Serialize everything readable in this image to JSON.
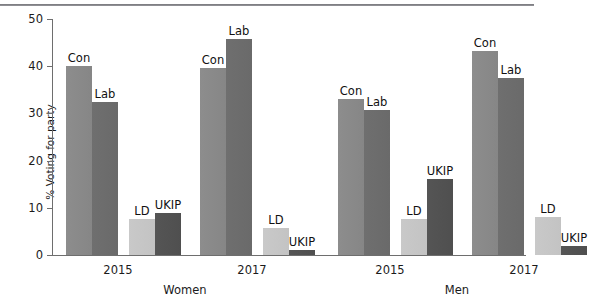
{
  "figure": {
    "ylabel": "% Voting for party"
  },
  "axis": {
    "ticks": [
      {
        "value": 0,
        "label": "0"
      },
      {
        "value": 10,
        "label": "10"
      },
      {
        "value": 20,
        "label": "20"
      },
      {
        "value": 30,
        "label": "30"
      },
      {
        "value": 40,
        "label": "40"
      },
      {
        "value": 50,
        "label": "50"
      }
    ]
  },
  "panels": [
    {
      "label": "Women",
      "groups": [
        "2015",
        "2017"
      ]
    },
    {
      "label": "Men",
      "groups": [
        "2015",
        "2017"
      ]
    }
  ],
  "chart_data": {
    "type": "bar",
    "title": "",
    "xlabel": "",
    "ylabel": "% Voting for party",
    "ylim": [
      0,
      50
    ],
    "yticks": [
      0,
      10,
      20,
      30,
      40,
      50
    ],
    "grid": false,
    "legend": "none",
    "panel_labels": [
      "Women",
      "Men"
    ],
    "categories": [
      "Women 2015",
      "Women 2017",
      "Men 2015",
      "Men 2017"
    ],
    "series": [
      {
        "name": "Con",
        "color": "#8a8a8a",
        "values": [
          40.0,
          39.7,
          33.0,
          43.2
        ]
      },
      {
        "name": "Lab",
        "color": "#6d6d6d",
        "values": [
          32.5,
          45.8,
          30.7,
          37.6
        ]
      },
      {
        "name": "LD",
        "color": "#c6c6c6",
        "values": [
          7.7,
          5.7,
          7.6,
          8.0
        ]
      },
      {
        "name": "UKIP",
        "color": "#525252",
        "values": [
          9.0,
          1.0,
          16.0,
          2.0
        ]
      }
    ],
    "bars": [
      {
        "panel": "Women",
        "group": "2015",
        "party": "Con",
        "value": 40.0,
        "label": "Con"
      },
      {
        "panel": "Women",
        "group": "2015",
        "party": "Lab",
        "value": 32.5,
        "label": "Lab"
      },
      {
        "panel": "Women",
        "group": "2015",
        "party": "LD",
        "value": 7.7,
        "label": "LD"
      },
      {
        "panel": "Women",
        "group": "2015",
        "party": "UKIP",
        "value": 9.0,
        "label": "UKIP"
      },
      {
        "panel": "Women",
        "group": "2017",
        "party": "Con",
        "value": 39.7,
        "label": "Con"
      },
      {
        "panel": "Women",
        "group": "2017",
        "party": "Lab",
        "value": 45.8,
        "label": "Lab"
      },
      {
        "panel": "Women",
        "group": "2017",
        "party": "LD",
        "value": 5.7,
        "label": "LD"
      },
      {
        "panel": "Women",
        "group": "2017",
        "party": "UKIP",
        "value": 1.0,
        "label": "UKIP"
      },
      {
        "panel": "Men",
        "group": "2015",
        "party": "Con",
        "value": 33.0,
        "label": "Con"
      },
      {
        "panel": "Men",
        "group": "2015",
        "party": "Lab",
        "value": 30.7,
        "label": "Lab"
      },
      {
        "panel": "Men",
        "group": "2015",
        "party": "LD",
        "value": 7.6,
        "label": "LD"
      },
      {
        "panel": "Men",
        "group": "2015",
        "party": "UKIP",
        "value": 16.0,
        "label": "UKIP"
      },
      {
        "panel": "Men",
        "group": "2017",
        "party": "Con",
        "value": 43.2,
        "label": "Con"
      },
      {
        "panel": "Men",
        "group": "2017",
        "party": "Lab",
        "value": 37.6,
        "label": "Lab"
      },
      {
        "panel": "Men",
        "group": "2017",
        "party": "LD",
        "value": 8.0,
        "label": "LD"
      },
      {
        "panel": "Men",
        "group": "2017",
        "party": "UKIP",
        "value": 2.0,
        "label": "UKIP"
      }
    ]
  },
  "layout": {
    "bar_width": 26,
    "bar_x": [
      14,
      40,
      77,
      103,
      148,
      174,
      211,
      237,
      286,
      312,
      349,
      375,
      420,
      446,
      483,
      509
    ],
    "group_centers": [
      66,
      200,
      338,
      472
    ],
    "panel_centers": [
      133,
      405
    ]
  }
}
